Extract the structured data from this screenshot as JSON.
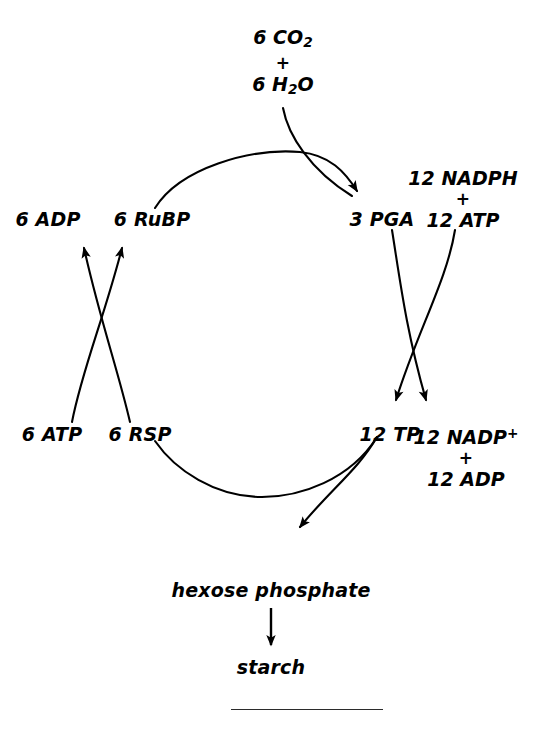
{
  "diagram": {
    "type": "cycle-diagram",
    "background_color": "#ffffff",
    "stroke_color": "#000000",
    "text_color": "#000000",
    "rule_color": "#2b2b2b",
    "inputs": {
      "co2_line1": "6 CO",
      "co2_sub": "2",
      "plus_1": "+",
      "h2o_line1": "6 H",
      "h2o_sub": "2",
      "h2o_tail": "O"
    },
    "nodes": {
      "adp_6": "6 ADP",
      "rubp_6": "6 RuBP",
      "pga_3": "3 PGA",
      "atp_6": "6 ATP",
      "rsp_6": "6 RSP",
      "tp_12": "12 TP",
      "hexose": "hexose phosphate",
      "starch": "starch"
    },
    "cofactors_top_right": {
      "line1": "12 NADPH",
      "plus": "+",
      "line2": "12 ATP"
    },
    "cofactors_bottom_right": {
      "line1_main": "12 NADP",
      "line1_sup": "+",
      "plus": "+",
      "line2": "12 ADP"
    },
    "arrows": [
      {
        "name": "co2-input-arrow",
        "from": "6 CO2 + 6 H2O",
        "to": "3 PGA"
      },
      {
        "name": "cycle-top-arc-arrow",
        "from": "6 RuBP",
        "to": "3 PGA"
      },
      {
        "name": "cycle-bottom-arc",
        "from": "12 TP",
        "to": "6 RSP"
      },
      {
        "name": "pga-to-nadp-arrow",
        "from": "3 PGA",
        "to": "12 NADP+ / 12 ADP"
      },
      {
        "name": "atp-to-tp-arrow",
        "from": "12 ATP",
        "to": "12 TP"
      },
      {
        "name": "rsp-to-adp-arrow",
        "from": "6 RSP",
        "to": "6 ADP"
      },
      {
        "name": "atp-to-rubp-arrow",
        "from": "6 ATP",
        "to": "6 RuBP"
      },
      {
        "name": "tp-to-hexose-arrow",
        "from": "12 TP",
        "to": "hexose phosphate"
      },
      {
        "name": "hexose-to-starch-arrow",
        "from": "hexose phosphate",
        "to": "starch"
      }
    ]
  }
}
